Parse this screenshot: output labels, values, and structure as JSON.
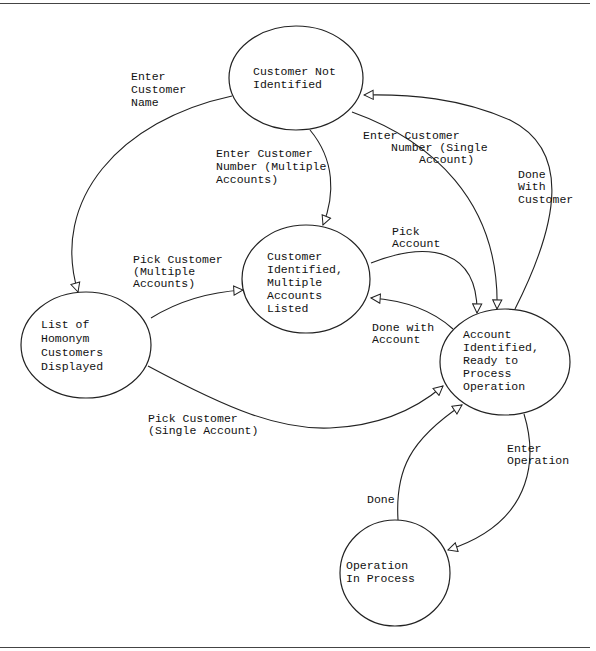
{
  "diagram": {
    "type": "state-transition",
    "states": [
      {
        "id": "customer_not_identified",
        "lines": [
          "Customer Not",
          "Identified"
        ]
      },
      {
        "id": "list_homonym",
        "lines": [
          "List of",
          "Homonym",
          "Customers",
          "Displayed"
        ]
      },
      {
        "id": "customer_identified_multiple",
        "lines": [
          "Customer",
          "Identified,",
          "Multiple",
          "Accounts",
          "Listed"
        ]
      },
      {
        "id": "account_identified",
        "lines": [
          "Account",
          "Identified,",
          "Ready to",
          "Process",
          "Operation"
        ]
      },
      {
        "id": "operation_in_process",
        "lines": [
          "Operation",
          "In Process"
        ]
      }
    ],
    "transitions": [
      {
        "from": "customer_not_identified",
        "to": "list_homonym",
        "lines": [
          "Enter",
          "Customer",
          "Name"
        ]
      },
      {
        "from": "customer_not_identified",
        "to": "customer_identified_multiple",
        "lines": [
          "Enter Customer",
          "Number (Multiple",
          "Accounts)"
        ]
      },
      {
        "from": "customer_not_identified",
        "to": "account_identified",
        "lines": [
          "Enter Customer",
          "Number (Single",
          "Account)"
        ]
      },
      {
        "from": "account_identified",
        "to": "customer_not_identified",
        "lines": [
          "Done",
          "With",
          "Customer"
        ]
      },
      {
        "from": "list_homonym",
        "to": "customer_identified_multiple",
        "lines": [
          "Pick Customer",
          "(Multiple",
          "Accounts)"
        ]
      },
      {
        "from": "customer_identified_multiple",
        "to": "account_identified",
        "lines": [
          "Pick",
          "Account"
        ]
      },
      {
        "from": "account_identified",
        "to": "customer_identified_multiple",
        "lines": [
          "Done with",
          "Account"
        ]
      },
      {
        "from": "list_homonym",
        "to": "account_identified",
        "lines": [
          "Pick Customer",
          "(Single Account)"
        ]
      },
      {
        "from": "account_identified",
        "to": "operation_in_process",
        "lines": [
          "Enter",
          "Operation"
        ]
      },
      {
        "from": "operation_in_process",
        "to": "account_identified",
        "lines": [
          "Done"
        ]
      }
    ]
  }
}
